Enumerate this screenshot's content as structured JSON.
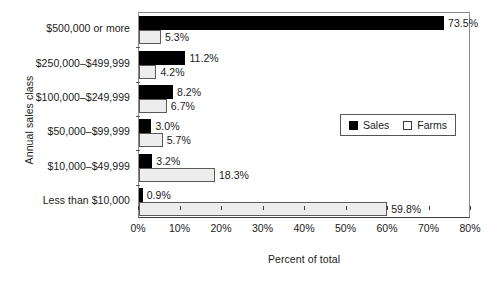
{
  "chart_data": {
    "type": "bar",
    "orientation": "horizontal",
    "title": "",
    "xlabel": "Percent of total",
    "ylabel": "Annual sales class",
    "xlim": [
      0,
      80
    ],
    "xtick_labels": [
      "0%",
      "10%",
      "20%",
      "30%",
      "40%",
      "50%",
      "60%",
      "70%",
      "80%"
    ],
    "xticks": [
      0,
      10,
      20,
      30,
      40,
      50,
      60,
      70,
      80
    ],
    "grid": false,
    "legend_position": "center-right",
    "categories": [
      "$500,000 or more",
      "$250,000–$499,999",
      "$100,000–$249,999",
      "$50,000–$99,999",
      "$10,000–$49,999",
      "Less than $10,000"
    ],
    "series": [
      {
        "name": "Sales",
        "color": "#000000",
        "values": [
          73.5,
          11.2,
          8.2,
          3.0,
          3.2,
          0.9
        ],
        "labels": [
          "73.5%",
          "11.2%",
          "8.2%",
          "3.0%",
          "3.2%",
          "0.9%"
        ]
      },
      {
        "name": "Farms",
        "color": "#ededed",
        "values": [
          5.3,
          4.2,
          6.7,
          5.7,
          18.3,
          59.8
        ],
        "labels": [
          "5.3%",
          "4.2%",
          "6.7%",
          "5.7%",
          "18.3%",
          "59.8%"
        ]
      }
    ]
  },
  "legend": {
    "items": [
      {
        "label": "Sales",
        "swatch": "filled-square-icon"
      },
      {
        "label": "Farms",
        "swatch": "open-square-icon"
      }
    ]
  },
  "axes": {
    "y_title": "Annual sales class",
    "x_title": "Percent of total"
  }
}
